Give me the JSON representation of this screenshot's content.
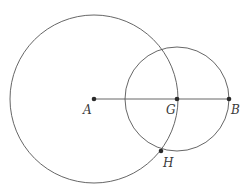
{
  "diagram": {
    "title": "",
    "stroke_color": "#555555",
    "point_color": "#2b2b2b",
    "points": {
      "A": {
        "label": "A",
        "x": 94,
        "y": 99
      },
      "G": {
        "label": "G",
        "x": 177,
        "y": 99
      },
      "B": {
        "label": "B",
        "x": 229,
        "y": 99
      },
      "H": {
        "label": "H",
        "x": 161,
        "y": 151
      }
    },
    "circles": [
      {
        "name": "circle-centered-A",
        "center": "A",
        "through": "G",
        "cx": 94,
        "cy": 99,
        "r": 84
      },
      {
        "name": "circle-centered-G",
        "center": "G",
        "through": "B",
        "cx": 177,
        "cy": 99,
        "r": 52
      }
    ],
    "segments": [
      {
        "name": "segment-AB",
        "from": "A",
        "to": "B"
      }
    ]
  }
}
